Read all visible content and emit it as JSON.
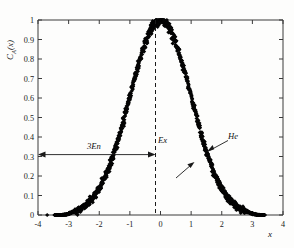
{
  "figure": {
    "background_color": "#fdfdfc",
    "ink_color": "#101010"
  },
  "chart_data": {
    "type": "scatter",
    "title": "",
    "subtitle": "",
    "xlabel": "x",
    "ylabel": "C_A(x)",
    "ylabel_display": "C",
    "ylabel_sub": "A",
    "ylabel_tail": "(x)",
    "xlim": [
      -4,
      4
    ],
    "ylim": [
      0,
      1
    ],
    "grid": false,
    "legend": null,
    "legend_position": "none",
    "xticks": [
      -4,
      -3,
      -2,
      -1,
      0,
      1,
      2,
      3,
      4
    ],
    "xtick_labels": [
      "-4",
      "-3",
      "-2",
      "-1",
      "0",
      "1",
      "2",
      "3",
      "4"
    ],
    "yticks": [
      0,
      0.1,
      0.2,
      0.3,
      0.4,
      0.5,
      0.6,
      0.7,
      0.8,
      0.9,
      1
    ],
    "ytick_labels": [
      "0",
      "0.1",
      "0.2",
      "0.3",
      "0.4",
      "0.5",
      "0.6",
      "0.7",
      "0.8",
      "0.9",
      "1"
    ],
    "marker": "filled-diamond",
    "marker_size": 2.1,
    "series": [
      {
        "name": "C_A(x)",
        "description": "Dense bell-shaped autocorrelation scatter, peak value 1 at x = 0",
        "peak_x": 0,
        "peak_y": 1,
        "half_width_at_half_max": 1.18,
        "x_data_min": -3.7,
        "x_data_max": 3.4,
        "profile_note": "approximately exp(-(x/1.42)^2) with scatter noise; tails reach y = 0 near x = -2.9 and x = 2.95",
        "outliers": [
          {
            "x": -3.7,
            "y": 0.0
          },
          {
            "x": 3.4,
            "y": 0.0
          }
        ]
      }
    ],
    "annotations": [
      {
        "name": "span-arrow",
        "label": "3En",
        "type": "double-headed-arrow",
        "y": 0.31,
        "x_start": -4,
        "x_end": 0,
        "label_x": -2.15,
        "label_y": 0.365
      },
      {
        "name": "center-line",
        "label": "Ex",
        "type": "dashed-vertical-line",
        "x": 0,
        "label_x": 0.12,
        "label_y": 0.42
      },
      {
        "name": "pointer-upper",
        "label": "He",
        "type": "leader-arrow",
        "label_x": 2.05,
        "label_y": 0.43,
        "tip_x": 1.6,
        "tip_y": 0.33
      },
      {
        "name": "pointer-lower",
        "label": "",
        "type": "leader-arrow",
        "tail_x": 1.17,
        "tail_y": 0.135,
        "tip_x": 1.53,
        "tip_y": 0.225
      }
    ]
  }
}
